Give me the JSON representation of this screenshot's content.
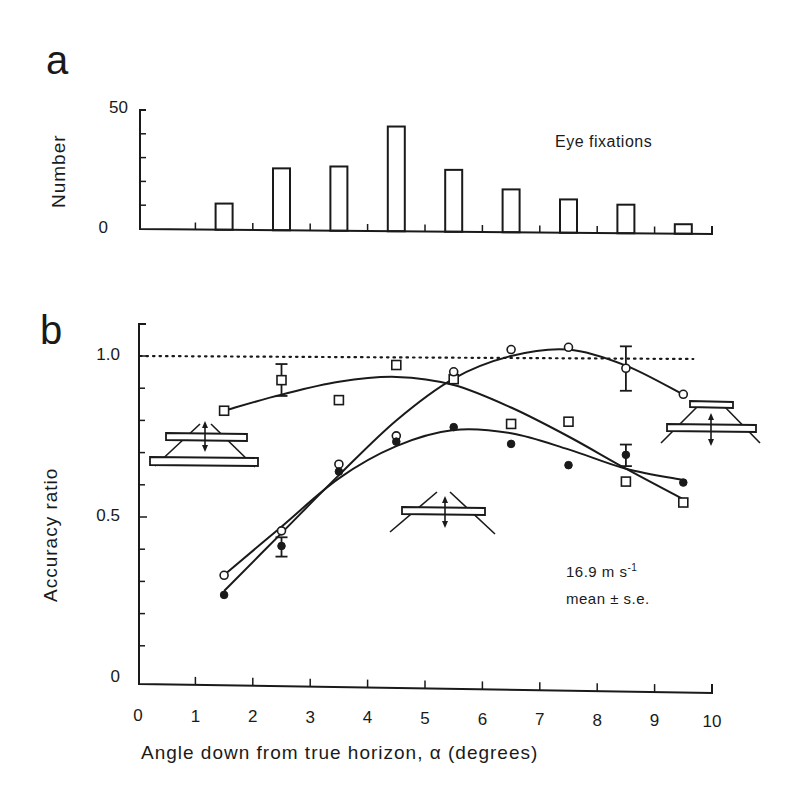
{
  "panels": {
    "a": {
      "label": "a"
    },
    "b": {
      "label": "b"
    }
  },
  "chart_data": [
    {
      "type": "bar",
      "panel": "a",
      "title": "",
      "annotation": "Eye fixations",
      "xlabel": "",
      "ylabel": "Number",
      "yticks": [
        "0",
        "50"
      ],
      "ylim": [
        0,
        50
      ],
      "xlim": [
        0,
        10
      ],
      "categories": [
        1.5,
        2.5,
        3.5,
        4.5,
        5.5,
        6.5,
        7.5,
        8.5,
        9.5
      ],
      "values": [
        11,
        26,
        27,
        44,
        26,
        18,
        14,
        12,
        4
      ],
      "grid": false
    },
    {
      "type": "scatter",
      "panel": "b",
      "title": "",
      "xlabel": "Angle down from true horizon, α (degrees)",
      "ylabel": "Accuracy ratio",
      "xticks": [
        "0",
        "1",
        "2",
        "3",
        "4",
        "5",
        "6",
        "7",
        "8",
        "9",
        "10"
      ],
      "yticks": [
        "0",
        "0.5",
        "1.0"
      ],
      "xlim": [
        0,
        10
      ],
      "ylim": [
        0,
        1.1
      ],
      "reference_line": {
        "y": 1.0,
        "style": "dotted"
      },
      "annotations": [
        "16.9 m s-1",
        "mean ± s.e."
      ],
      "x": [
        1.5,
        2.5,
        3.5,
        4.5,
        5.5,
        6.5,
        7.5,
        8.5,
        9.5
      ],
      "series": [
        {
          "name": "open squares (single bar above horizon, converging lines below)",
          "marker": "open-square",
          "values": [
            0.83,
            0.925,
            0.863,
            0.972,
            0.928,
            0.789,
            0.796,
            0.61,
            0.545
          ],
          "error_bars": {
            "2.5": [
              0.876,
              0.975
            ]
          },
          "fit_curve": [
            [
              1.5,
              0.83
            ],
            [
              2.5,
              0.88
            ],
            [
              3.5,
              0.92
            ],
            [
              4.5,
              0.935
            ],
            [
              5.5,
              0.91
            ],
            [
              6.5,
              0.84
            ],
            [
              7.5,
              0.75
            ],
            [
              8.5,
              0.65
            ],
            [
              9.5,
              0.555
            ]
          ]
        },
        {
          "name": "open circles",
          "marker": "open-circle",
          "values": [
            0.319,
            0.457,
            0.664,
            0.752,
            0.951,
            1.02,
            1.027,
            0.962,
            0.881
          ],
          "error_bars": {
            "8.5": [
              0.892,
              1.03
            ]
          },
          "fit_curve": [
            [
              1.5,
              0.27
            ],
            [
              2.5,
              0.45
            ],
            [
              3.5,
              0.63
            ],
            [
              4.5,
              0.8
            ],
            [
              5.5,
              0.93
            ],
            [
              6.5,
              1.0
            ],
            [
              7.5,
              1.02
            ],
            [
              8.5,
              0.97
            ],
            [
              9.5,
              0.88
            ]
          ]
        },
        {
          "name": "filled circles",
          "marker": "filled-circle",
          "values": [
            0.258,
            0.41,
            0.641,
            0.734,
            0.779,
            0.727,
            0.661,
            0.693,
            0.607
          ],
          "error_bars": {
            "2.5": [
              0.377,
              0.437
            ],
            "8.5": [
              0.658,
              0.725
            ]
          },
          "fit_curve": [
            [
              1.5,
              0.32
            ],
            [
              2.5,
              0.47
            ],
            [
              3.5,
              0.62
            ],
            [
              4.5,
              0.72
            ],
            [
              5.5,
              0.77
            ],
            [
              6.5,
              0.76
            ],
            [
              7.5,
              0.71
            ],
            [
              8.5,
              0.65
            ],
            [
              9.5,
              0.615
            ]
          ]
        }
      ],
      "grid": false
    }
  ],
  "icons": {
    "left": "converging-lines-bar-icon",
    "middle": "crossing-lines-bar-icon",
    "right": "diverging-lines-bar-icon"
  }
}
